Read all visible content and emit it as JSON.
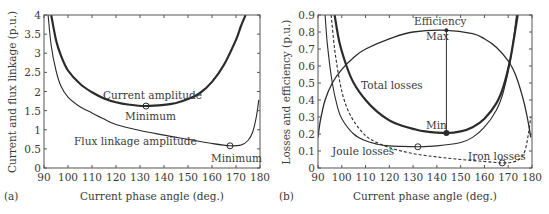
{
  "chart_data": [
    {
      "panel": "(a)",
      "type": "line",
      "title": "",
      "xlabel": "Current phase angle (deg.)",
      "ylabel": "Current and flux linkage (p.u.)",
      "xlim": [
        90,
        180
      ],
      "ylim": [
        0,
        4
      ],
      "xticks": [
        90,
        100,
        110,
        120,
        130,
        140,
        150,
        160,
        170,
        180
      ],
      "yticks": [
        0,
        0.5,
        1,
        1.5,
        2,
        2.5,
        3,
        3.5,
        4
      ],
      "ytick_labels": [
        "0",
        "0.5",
        "1",
        "1.5",
        "2",
        "2.5",
        "3",
        "3.5",
        "4"
      ],
      "grid": false,
      "series": [
        {
          "name": "Current amplitude",
          "style": "thick-solid",
          "x": [
            93,
            95,
            97,
            100,
            105,
            110,
            115,
            120,
            125,
            132,
            140,
            145,
            150,
            155,
            160,
            165,
            170,
            172,
            174
          ],
          "y": [
            4.0,
            3.35,
            2.95,
            2.55,
            2.2,
            1.98,
            1.82,
            1.72,
            1.66,
            1.62,
            1.65,
            1.7,
            1.8,
            1.96,
            2.25,
            2.7,
            3.35,
            3.7,
            4.0
          ]
        },
        {
          "name": "Flux linkage amplitude",
          "style": "thin-solid",
          "x": [
            91.7,
            93,
            95,
            97,
            100,
            105,
            110,
            115,
            120,
            130,
            140,
            150,
            160,
            167.5,
            172,
            175,
            177,
            178.5,
            179.5
          ],
          "y": [
            4.0,
            3.2,
            2.55,
            2.15,
            1.85,
            1.6,
            1.44,
            1.28,
            1.14,
            0.98,
            0.86,
            0.75,
            0.64,
            0.58,
            0.6,
            0.72,
            0.95,
            1.35,
            1.78
          ]
        }
      ],
      "annotations": [
        {
          "text": "Current amplitude",
          "x": 112,
          "y": 1.9
        },
        {
          "text": "Minimum",
          "x": 132.5,
          "y": 1.62,
          "marker": "circle"
        },
        {
          "text": "Flux linkage amplitude",
          "x": 110,
          "y": 0.8
        },
        {
          "text": "Minimum",
          "x": 167.5,
          "y": 0.58,
          "marker": "circle"
        }
      ]
    },
    {
      "panel": "(b)",
      "type": "line",
      "title": "",
      "xlabel": "Current phase angle (deg.)",
      "ylabel": "Losses and efficiency (p.u.)",
      "xlim": [
        90,
        180
      ],
      "ylim": [
        0,
        0.9
      ],
      "xticks": [
        90,
        100,
        110,
        120,
        130,
        140,
        150,
        160,
        170,
        180
      ],
      "yticks": [
        0,
        0.1,
        0.2,
        0.3,
        0.4,
        0.5,
        0.6,
        0.7,
        0.8,
        0.9
      ],
      "ytick_labels": [
        "0",
        "0.1",
        "0.2",
        "0.3",
        "0.4",
        "0.5",
        "0.6",
        "0.7",
        "0.8",
        "0.9"
      ],
      "grid": false,
      "series": [
        {
          "name": "Efficiency",
          "style": "medium-solid",
          "x": [
            90,
            91,
            93,
            96,
            100,
            105,
            110,
            120,
            130,
            144,
            155,
            160,
            165,
            170,
            173,
            176,
            178,
            179.5
          ],
          "y": [
            0.18,
            0.28,
            0.4,
            0.5,
            0.58,
            0.65,
            0.7,
            0.76,
            0.8,
            0.81,
            0.79,
            0.76,
            0.71,
            0.63,
            0.55,
            0.42,
            0.3,
            0.18
          ]
        },
        {
          "name": "Total losses",
          "style": "thick-solid",
          "x": [
            97,
            99,
            102,
            105,
            110,
            115,
            120,
            125,
            130,
            135,
            144,
            150,
            155,
            160,
            165,
            168,
            171,
            174
          ],
          "y": [
            0.9,
            0.74,
            0.6,
            0.5,
            0.4,
            0.33,
            0.28,
            0.25,
            0.23,
            0.215,
            0.206,
            0.215,
            0.24,
            0.29,
            0.38,
            0.48,
            0.65,
            0.9
          ]
        },
        {
          "name": "Joule losses",
          "style": "thin-solid",
          "x": [
            93,
            94,
            96,
            98,
            100,
            105,
            110,
            115,
            120,
            125,
            132,
            140,
            150,
            155,
            160,
            165,
            168,
            171,
            173.5
          ],
          "y": [
            0.9,
            0.72,
            0.5,
            0.37,
            0.29,
            0.2,
            0.16,
            0.14,
            0.13,
            0.127,
            0.125,
            0.13,
            0.15,
            0.18,
            0.24,
            0.34,
            0.45,
            0.64,
            0.9
          ]
        },
        {
          "name": "Iron losses",
          "style": "dashed",
          "x": [
            95.5,
            97,
            99,
            101,
            104,
            108,
            112,
            120,
            130,
            140,
            150,
            160,
            167.5,
            172,
            175,
            177,
            178.5,
            179.5
          ],
          "y": [
            0.9,
            0.7,
            0.52,
            0.4,
            0.3,
            0.22,
            0.17,
            0.12,
            0.085,
            0.065,
            0.05,
            0.038,
            0.03,
            0.035,
            0.055,
            0.1,
            0.2,
            0.3
          ]
        }
      ],
      "annotations": [
        {
          "text": "Efficiency",
          "x": 144,
          "y": 0.86
        },
        {
          "text": "Max",
          "x": 144,
          "y": 0.81,
          "marker": "dot"
        },
        {
          "text": "Min",
          "x": 144,
          "y": 0.206,
          "marker": "dot"
        },
        {
          "text": "Total losses",
          "x": 108,
          "y": 0.5
        },
        {
          "text": "Joule losses",
          "x": 100,
          "y": 0.1
        },
        {
          "text": "Iron losses",
          "x": 162,
          "y": 0.055
        },
        {
          "text": "",
          "x": 132,
          "y": 0.125,
          "marker": "circle"
        },
        {
          "text": "",
          "x": 167.5,
          "y": 0.03,
          "marker": "circle"
        }
      ]
    }
  ],
  "panels": {
    "a": {
      "panel_label": "(a)",
      "xlabel": "Current phase angle (deg.)",
      "ylabel": "Current and flux linkage (p.u.)",
      "label_current": "Current amplitude",
      "label_current_min": "Minimum",
      "label_flux": "Flux linkage amplitude",
      "label_flux_min": "Minimum"
    },
    "b": {
      "panel_label": "(b)",
      "xlabel": "Current phase angle (deg.)",
      "ylabel": "Losses and efficiency (p.u.)",
      "label_efficiency": "Efficiency",
      "label_max": "Max",
      "label_min": "Min",
      "label_total": "Total losses",
      "label_joule": "Joule losses",
      "label_iron": "Iron losses"
    }
  },
  "colors": {
    "line": "#2b2b2b",
    "text": "#3a3a3a",
    "frame": "#555555"
  }
}
